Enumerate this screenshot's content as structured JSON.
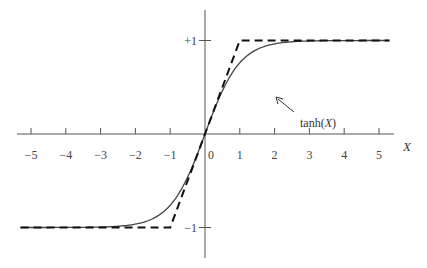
{
  "chart_data": {
    "type": "line",
    "title": "",
    "xlabel": "X",
    "ylabel": "",
    "xlim": [
      -5.3,
      5.3
    ],
    "ylim": [
      -1.35,
      1.35
    ],
    "x_ticks": [
      -5,
      -4,
      -3,
      -2,
      -1,
      0,
      1,
      2,
      3,
      4,
      5
    ],
    "x_tick_labels": [
      "−5",
      "−4",
      "−3",
      "−2",
      "−1",
      "0",
      "1",
      "2",
      "3",
      "4",
      "5"
    ],
    "y_ticks": [
      1,
      -1
    ],
    "y_tick_labels": [
      "+1",
      "−1"
    ],
    "grid": false,
    "series": [
      {
        "name": "tanh(X)",
        "style": "solid",
        "function": "tanh",
        "x_range": [
          -5.3,
          5.3
        ]
      },
      {
        "name": "piecewise-linear approximation",
        "style": "dashed",
        "x": [
          -5.3,
          -1,
          1,
          5.3
        ],
        "y": [
          -1,
          -1,
          1,
          1
        ]
      }
    ],
    "annotations": [
      {
        "text": "tanh(X)",
        "points_to": "tanh curve near X≈0.9",
        "arrow": true
      }
    ]
  },
  "annotation": {
    "prefix": "tanh(",
    "var": "X",
    "suffix": ")"
  }
}
